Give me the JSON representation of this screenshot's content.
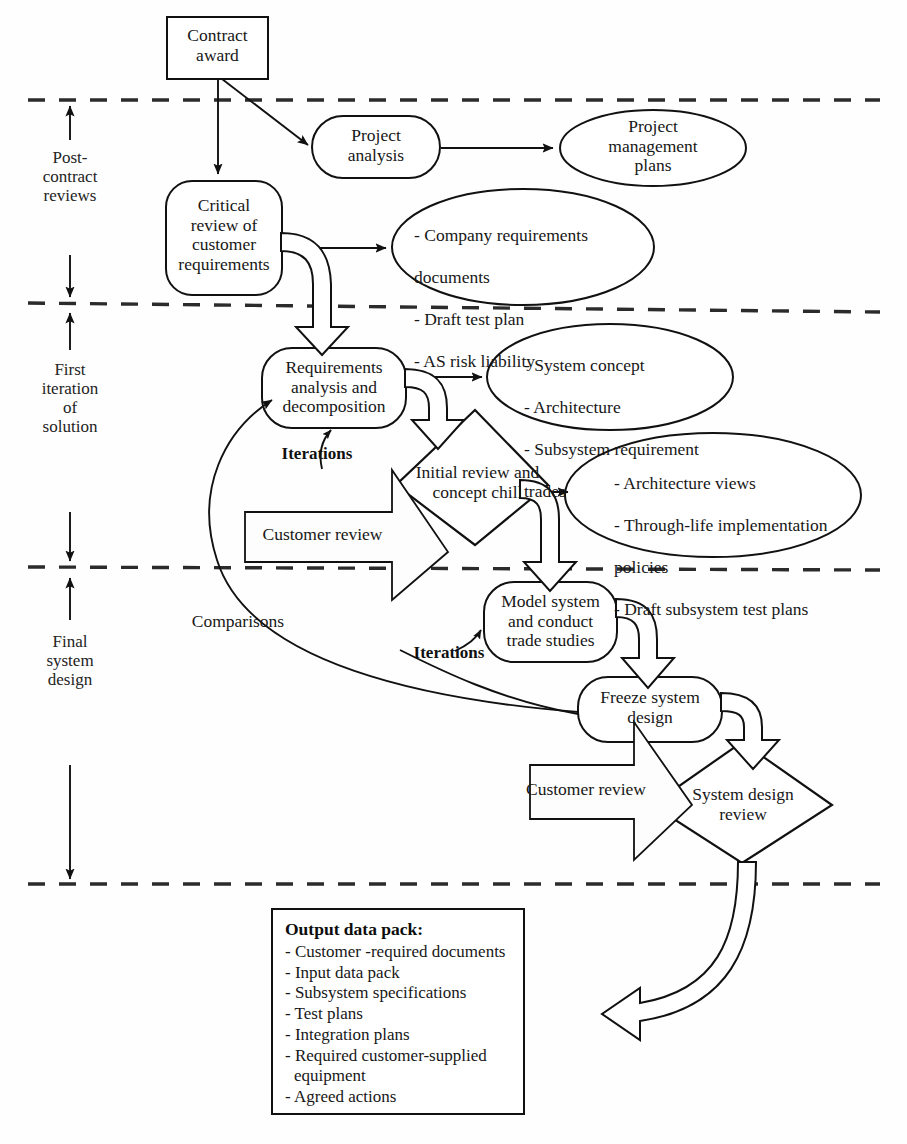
{
  "diagram": {
    "phases": [
      {
        "id": "post-contract",
        "label": "Post-\ncontract\nreviews"
      },
      {
        "id": "first-iteration",
        "label": "First\niteration\nof\nsolution"
      },
      {
        "id": "final-design",
        "label": "Final\nsystem\ndesign"
      }
    ],
    "nodes": {
      "contract_award": "Contract\naward",
      "project_analysis": "Project\nanalysis",
      "project_management_plans": "Project\nmanagement\nplans",
      "critical_review": "Critical\nreview of\ncustomer\nrequirements",
      "requirements_analysis": "Requirements\nanalysis and\ndecomposition",
      "model_system": "Model system\nand conduct\ntrade studies",
      "freeze_system_design": "Freeze system\ndesign",
      "initial_review_diamond": "Initial review and\nconcept chill",
      "system_design_review_diamond": "System design\nreview"
    },
    "artifacts": {
      "post_contract_outputs": [
        "- Company requirements",
        "  documents",
        "- Draft test plan",
        "- AS risk liability"
      ],
      "requirements_outputs": [
        "- System concept",
        "- Architecture",
        "- Subsystem requirement",
        "  trades"
      ],
      "concept_outputs": [
        "- Architecture views",
        "- Through-life implementation",
        "  policies",
        "- Draft subsystem test plans"
      ]
    },
    "edge_labels": {
      "iterations_top": "Iterations",
      "iterations_bottom": "Iterations",
      "comparisons": "Comparisons"
    },
    "banners": {
      "customer_review_1": "Customer review",
      "customer_review_2": "Customer review"
    },
    "output_pack": {
      "title": "Output data pack:",
      "items": [
        "- Customer -required documents",
        "- Input data pack",
        "- Subsystem specifications",
        "- Test plans",
        "- Integration plans",
        "- Required customer-supplied\n   equipment",
        "- Agreed actions"
      ]
    },
    "colors": {
      "stroke": "#111111",
      "background": "#ffffff",
      "text": "#171717"
    }
  }
}
